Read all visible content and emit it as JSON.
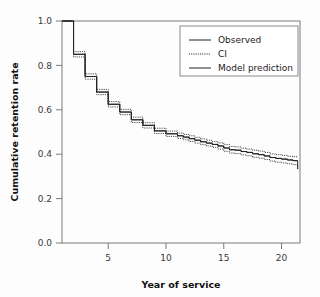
{
  "chart_data": {
    "type": "line",
    "title": "",
    "subtitle": "",
    "xlabel": "Year of service",
    "ylabel": "Cumulative retention rate",
    "xlim": [
      1,
      21.6
    ],
    "ylim": [
      0.0,
      1.0
    ],
    "grid": false,
    "legend_position": "top-right",
    "xticks": [
      5,
      10,
      15,
      20
    ],
    "xtick_labels": [
      "5",
      "10",
      "15",
      "20"
    ],
    "yticks": [
      0.0,
      0.2,
      0.4,
      0.6,
      0.8,
      1.0
    ],
    "ytick_labels": [
      "0.0",
      "0.2",
      "0.4",
      "0.6",
      "0.8",
      "1.0"
    ],
    "step_style": "post",
    "legend": [
      {
        "label": "Observed",
        "style": "solid"
      },
      {
        "label": "CI",
        "style": "dotted"
      },
      {
        "label": "Model prediction",
        "style": "solid"
      }
    ],
    "series": [
      {
        "name": "Observed",
        "style": "solid",
        "x": [
          1.0,
          2.0,
          3.0,
          4.0,
          5.0,
          6.0,
          7.0,
          8.0,
          9.0,
          10.0,
          11.0,
          11.5,
          12.0,
          12.5,
          13.0,
          13.5,
          14.0,
          14.5,
          15.0,
          15.5,
          16.0,
          16.5,
          17.0,
          17.5,
          18.0,
          18.5,
          19.0,
          19.5,
          20.0,
          20.5,
          21.0,
          21.4
        ],
        "values": [
          1.0,
          0.85,
          0.75,
          0.68,
          0.625,
          0.59,
          0.555,
          0.53,
          0.505,
          0.492,
          0.483,
          0.477,
          0.47,
          0.463,
          0.456,
          0.45,
          0.444,
          0.437,
          0.428,
          0.42,
          0.418,
          0.412,
          0.408,
          0.402,
          0.398,
          0.392,
          0.385,
          0.381,
          0.378,
          0.374,
          0.371,
          0.371
        ]
      },
      {
        "name": "CI upper",
        "style": "dotted",
        "x": [
          1.0,
          2.0,
          3.0,
          4.0,
          5.0,
          6.0,
          7.0,
          8.0,
          9.0,
          10.0,
          11.0,
          11.5,
          12.0,
          12.5,
          13.0,
          13.5,
          14.0,
          14.5,
          15.0,
          15.5,
          16.0,
          16.5,
          17.0,
          17.5,
          18.0,
          18.5,
          19.0,
          19.5,
          20.0,
          20.5,
          21.0,
          21.4
        ],
        "values": [
          1.0,
          0.862,
          0.762,
          0.692,
          0.637,
          0.602,
          0.567,
          0.542,
          0.517,
          0.504,
          0.495,
          0.489,
          0.483,
          0.476,
          0.469,
          0.463,
          0.457,
          0.451,
          0.443,
          0.435,
          0.433,
          0.427,
          0.423,
          0.418,
          0.414,
          0.408,
          0.401,
          0.398,
          0.395,
          0.391,
          0.389,
          0.389
        ]
      },
      {
        "name": "CI lower",
        "style": "dotted",
        "x": [
          1.0,
          2.0,
          3.0,
          4.0,
          5.0,
          6.0,
          7.0,
          8.0,
          9.0,
          10.0,
          11.0,
          11.5,
          12.0,
          12.5,
          13.0,
          13.5,
          14.0,
          14.5,
          15.0,
          15.5,
          16.0,
          16.5,
          17.0,
          17.5,
          18.0,
          18.5,
          19.0,
          19.5,
          20.0,
          20.5,
          21.0,
          21.4
        ],
        "values": [
          1.0,
          0.838,
          0.738,
          0.668,
          0.613,
          0.578,
          0.543,
          0.518,
          0.493,
          0.48,
          0.471,
          0.465,
          0.457,
          0.45,
          0.443,
          0.437,
          0.431,
          0.423,
          0.413,
          0.405,
          0.403,
          0.397,
          0.393,
          0.386,
          0.382,
          0.376,
          0.369,
          0.364,
          0.361,
          0.357,
          0.353,
          0.333
        ]
      },
      {
        "name": "Model prediction",
        "style": "solid",
        "x": [
          1.0,
          2.0,
          3.0,
          4.0,
          5.0,
          6.0,
          7.0,
          8.0,
          9.0,
          10.0,
          11.0,
          11.5,
          12.0,
          12.5,
          13.0,
          13.5,
          14.0,
          14.5,
          15.0,
          15.5,
          16.0,
          16.5,
          17.0,
          17.5,
          18.0,
          18.5,
          19.0,
          19.5,
          20.0,
          20.5,
          21.0,
          21.4
        ],
        "values": [
          1.0,
          0.85,
          0.75,
          0.68,
          0.625,
          0.59,
          0.555,
          0.53,
          0.505,
          0.492,
          0.483,
          0.477,
          0.47,
          0.463,
          0.456,
          0.45,
          0.444,
          0.437,
          0.428,
          0.42,
          0.418,
          0.412,
          0.408,
          0.402,
          0.398,
          0.392,
          0.385,
          0.381,
          0.378,
          0.374,
          0.371,
          0.371
        ]
      }
    ],
    "final_ci_drop": {
      "x": 21.4,
      "from": 0.371,
      "to": 0.333
    }
  }
}
